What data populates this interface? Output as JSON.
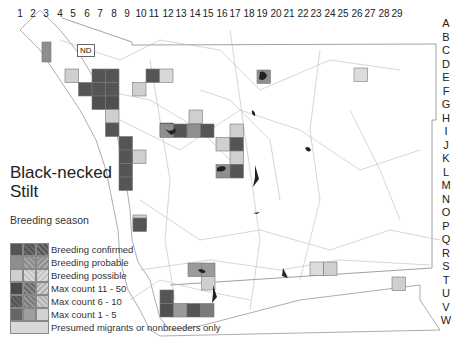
{
  "map": {
    "title_line1": "Black-necked",
    "title_line2": "Stilt",
    "subtitle": "Breeding season",
    "nd_label": "ND",
    "column_labels": [
      "1",
      "2",
      "3",
      "4",
      "5",
      "6",
      "7",
      "8",
      "9",
      "10",
      "11",
      "12",
      "13",
      "14",
      "15",
      "16",
      "17",
      "18",
      "19",
      "20",
      "21",
      "22",
      "23",
      "24",
      "25",
      "26",
      "27",
      "28",
      "29"
    ],
    "row_labels": [
      "A",
      "B",
      "C",
      "D",
      "E",
      "F",
      "G",
      "H",
      "I",
      "J",
      "K",
      "L",
      "M",
      "N",
      "O",
      "P",
      "Q",
      "R",
      "S",
      "T",
      "U",
      "V",
      "W"
    ],
    "legend": [
      {
        "label": "Breeding confirmed",
        "colors": [
          "#555555",
          "#5e5e5e",
          "#6a6a6a"
        ]
      },
      {
        "label": "Breeding probable",
        "colors": [
          "#8e8e8e",
          "#9a9a9a",
          "#a4a4a4"
        ]
      },
      {
        "label": "Breeding possible",
        "colors": [
          "#c8c8c8",
          "#cacaca",
          "#d0d0d0"
        ]
      },
      {
        "label": "Max count 11 - 50",
        "colors": [
          "#4a4a4a",
          "#7a7a7a",
          "#c4c4c4"
        ]
      },
      {
        "label": "Max count 6 - 10",
        "colors": [
          "#5a5a5a",
          "#8a8a8a",
          "#bdbdbd"
        ]
      },
      {
        "label": "Max count 1 - 5",
        "colors": [
          "#6a6a6a",
          "#9e9e9e",
          "#d2d2d2"
        ]
      },
      {
        "label": "Presumed migrants or nonbreeders only",
        "colors": [
          "#d8d8d8"
        ]
      }
    ],
    "colors": {
      "confirmed": "#555555",
      "probable": "#8f8f8f",
      "possible": "#cfcfcf",
      "migrant": "#dcdcdc",
      "border": "#777777",
      "water": "#222222"
    }
  }
}
